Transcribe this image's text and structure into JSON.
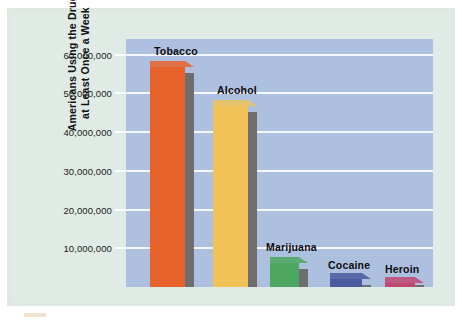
{
  "chart_data": {
    "type": "bar",
    "title": "",
    "xlabel": "",
    "ylabel": "Americans Using the Drug at Least Once a Week",
    "ylabel_line1": "Americans Using the Drug",
    "ylabel_line2": "at Least Once a Week",
    "categories": [
      "Tobacco",
      "Alcohol",
      "Marijuana",
      "Cocaine",
      "Heroin"
    ],
    "values": [
      56800000,
      46600000,
      6200000,
      2100000,
      1000000
    ],
    "ylim": [
      0,
      64000000
    ],
    "ytick_values": [
      10000000,
      20000000,
      30000000,
      40000000,
      50000000,
      60000000
    ],
    "ytick_labels": [
      "10,000,000",
      "20,000,000",
      "30,000,000",
      "40,000,000",
      "50,000,000",
      "60,000,000"
    ],
    "grid": true,
    "legend": "none",
    "bar_colors": [
      "#e8622c",
      "#f0c258",
      "#4ca860",
      "#4a5a9e",
      "#c04870"
    ],
    "bar_shadow_color": "#6e6e6e",
    "plot_background": "#aec0e0",
    "page_background": "#dfe9e2",
    "gridline_color": "#f4f7fb"
  },
  "bars": [
    {
      "label": "Tobacco",
      "value": 56800000,
      "color": "#e8622c",
      "left": 24,
      "width": 35,
      "label_left": 28,
      "label_bottom_offset": 14
    },
    {
      "label": "Alcohol",
      "value": 46600000,
      "color": "#f0c258",
      "left": 87,
      "width": 35,
      "label_left": 91,
      "label_bottom_offset": 14
    },
    {
      "label": "Marijuana",
      "value": 6200000,
      "color": "#4ca860",
      "left": 144,
      "width": 29,
      "label_left": 140,
      "label_bottom_offset": 14
    },
    {
      "label": "Cocaine",
      "value": 2100000,
      "color": "#4a5a9e",
      "left": 204,
      "width": 32,
      "label_left": 202,
      "label_bottom_offset": 12
    },
    {
      "label": "Heroin",
      "value": 1000000,
      "color": "#c04870",
      "left": 259,
      "width": 30,
      "label_left": 259,
      "label_bottom_offset": 12
    }
  ]
}
